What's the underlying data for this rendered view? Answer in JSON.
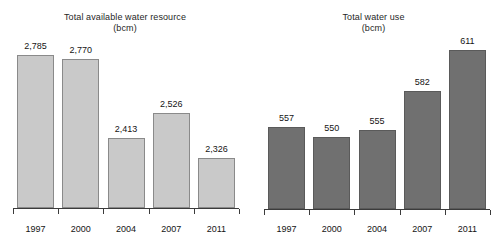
{
  "chart_data": [
    {
      "type": "bar",
      "panel": "left",
      "title": "Total available water resource",
      "subtitle": "(bcm)",
      "xlabel": "",
      "ylabel": "",
      "categories": [
        "1997",
        "2000",
        "2004",
        "2007",
        "2011"
      ],
      "values": [
        2785,
        2770,
        2413,
        2526,
        2326
      ],
      "value_labels": [
        "2,785",
        "2,770",
        "2,413",
        "2,526",
        "2,326"
      ],
      "bar_color": "#c9c9c9",
      "bar_edge_color": "#8a8a8a",
      "baseline_value": 2100,
      "ylim": [
        2100,
        2880
      ],
      "grid": false,
      "legend": "none",
      "axis_color": "#3b3b3b"
    },
    {
      "type": "bar",
      "panel": "right",
      "title": "Total water use",
      "subtitle": "(bcm)",
      "xlabel": "",
      "ylabel": "",
      "categories": [
        "1997",
        "2000",
        "2004",
        "2007",
        "2011"
      ],
      "values": [
        557,
        550,
        555,
        582,
        611
      ],
      "value_labels": [
        "557",
        "550",
        "555",
        "582",
        "611"
      ],
      "bar_color": "#707070",
      "bar_edge_color": "#5a5a5a",
      "baseline_value": 500,
      "ylim": [
        500,
        622
      ],
      "grid": false,
      "legend": "none",
      "axis_color": "#3b3b3b"
    }
  ]
}
